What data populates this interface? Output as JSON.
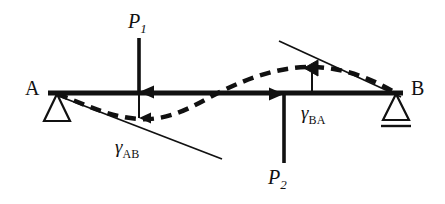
{
  "figure": {
    "type": "structural-beam-deflection-diagram",
    "background_color": "#ffffff",
    "line_color": "#111111"
  },
  "beam": {
    "name": "beam-member",
    "x_start": 48,
    "x_end": 403,
    "y": 93,
    "thickness": 5
  },
  "supports": [
    {
      "name": "support-a",
      "label": "A",
      "type": "pin",
      "x": 57,
      "y": 93,
      "label_x": 25,
      "label_y": 80
    },
    {
      "name": "support-b",
      "label": "B",
      "type": "roller",
      "x": 396,
      "y": 93,
      "label_x": 411,
      "label_y": 80
    }
  ],
  "loads": [
    {
      "name": "load-p1",
      "label": "P",
      "subscript": "1",
      "direction": "down",
      "x": 139,
      "tail_y": 38,
      "head_y": 93,
      "label_x": 128,
      "label_y": 12
    },
    {
      "name": "load-p2",
      "label": "P",
      "subscript": "2",
      "direction": "up",
      "x": 284,
      "tail_y": 163,
      "head_y": 93,
      "label_x": 268,
      "label_y": 168
    }
  ],
  "angles": [
    {
      "name": "angle-gamma-ab",
      "label": "γ",
      "subscript": "AB",
      "label_x": 115,
      "label_y": 138,
      "tangent_x1": 56,
      "tangent_y1": 95,
      "tangent_x2": 222,
      "tangent_y2": 159
    },
    {
      "name": "angle-gamma-ba",
      "label": "γ",
      "subscript": "BA",
      "label_x": 301,
      "label_y": 104,
      "tangent_x1": 279,
      "tangent_y1": 41,
      "tangent_x2": 400,
      "tangent_y2": 97
    }
  ],
  "deflection_curve": {
    "name": "deflected-shape",
    "style": "dashed",
    "dash_pattern": "11 7",
    "thickness": 4,
    "path": "M 57 94 C 85 104, 108 117, 139 119 C 172 121, 196 104, 218 93 C 248 78, 278 67, 310 67 C 345 67, 374 80, 396 93"
  },
  "annotations": [
    {
      "name": "deflection-marker-left",
      "type": "arrow-down",
      "x": 139,
      "y_top": 93,
      "y_bottom": 120
    },
    {
      "name": "deflection-marker-right",
      "type": "arrow-left-on-curve",
      "x": 312,
      "y": 68
    },
    {
      "name": "angle-leader-ba",
      "type": "vertical-leader",
      "x": 312,
      "y_top": 68,
      "y_bottom": 93
    }
  ]
}
